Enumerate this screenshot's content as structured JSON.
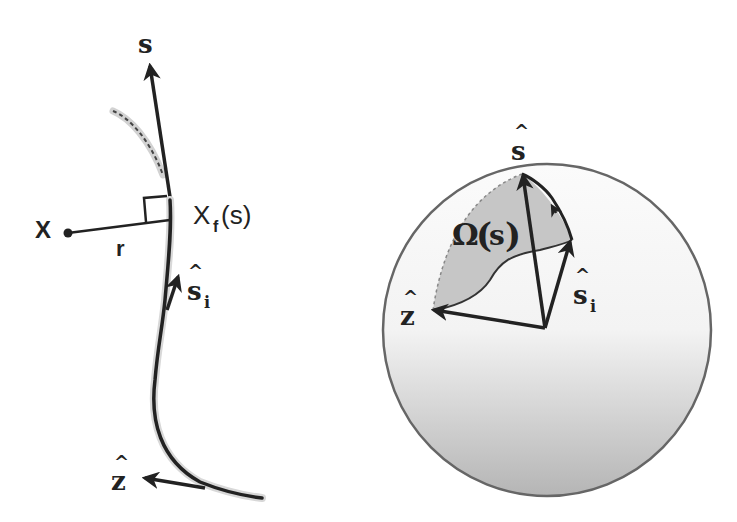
{
  "left_panel": {
    "labels": {
      "s_axis": "s",
      "x_point": "X",
      "r_distance": "r",
      "xf_main": "X",
      "xf_sub": "f",
      "xf_arg": "(s)",
      "s_hat_i_main": "s",
      "s_hat_i_sub": "i",
      "z_hat": "z",
      "hat": "^"
    }
  },
  "right_panel": {
    "labels": {
      "s_hat": "s",
      "omega": "Ω",
      "omega_arg": "s",
      "s_hat_i_main": "s",
      "s_hat_i_sub": "i",
      "z_hat": "z",
      "hat": "^"
    }
  },
  "colors": {
    "ink": "#222222",
    "shaded_region": "#c4c4c4",
    "sphere_edge": "#666666",
    "sphere_light": "#fafafa",
    "sphere_dark": "#b8b8b8",
    "curve_halo": "#d0d0d0"
  }
}
